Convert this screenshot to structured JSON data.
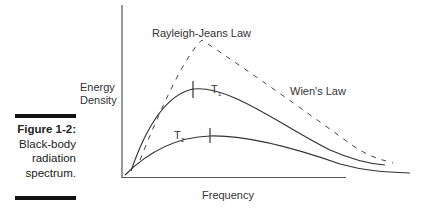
{
  "figure": {
    "caption_title": "Figure 1-2:",
    "caption_lines": [
      "Black-body",
      "radiation",
      "spectrum."
    ]
  },
  "diagram": {
    "y_axis_label_line1": "Energy",
    "y_axis_label_line2": "Density",
    "x_axis_label": "Frequency",
    "rayleigh_jeans_label": "Rayleigh-Jeans Law",
    "wien_label": "Wien's Law",
    "curve_t1_label": "T",
    "curve_t1_subscript": "1",
    "curve_t2_label": "T",
    "curve_t2_subscript": "2"
  }
}
